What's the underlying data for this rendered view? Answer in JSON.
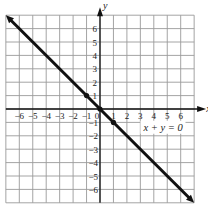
{
  "chart_data": {
    "type": "line",
    "title": "",
    "xlabel": "x",
    "ylabel": "y",
    "xlim": [
      -7,
      7
    ],
    "ylim": [
      -7,
      7
    ],
    "grid": true,
    "x_ticks": [
      -6,
      -5,
      -4,
      -3,
      -2,
      -1,
      0,
      1,
      2,
      3,
      4,
      5,
      6
    ],
    "y_ticks": [
      -6,
      -5,
      -4,
      -3,
      -2,
      -1,
      1,
      2,
      3,
      4,
      5,
      6
    ],
    "x_tick_labels": [
      "−6",
      "−5",
      "−4",
      "−3",
      "−2",
      "−1",
      "0",
      "1",
      "2",
      "3",
      "4",
      "5",
      "6"
    ],
    "y_tick_labels_pos": [
      "1",
      "2",
      "3",
      "4",
      "5",
      "6"
    ],
    "y_tick_labels_neg": [
      "−1",
      "−2",
      "−3",
      "−4",
      "−5",
      "−6"
    ],
    "series": [
      {
        "name": "x + y = 0",
        "equation": "x + y = 0",
        "x": [
          -7,
          7
        ],
        "y": [
          7,
          -7
        ],
        "arrows": "both",
        "color": "#111111"
      }
    ],
    "points": [
      {
        "x": -1,
        "y": 1
      },
      {
        "x": 0,
        "y": 0
      },
      {
        "x": 1,
        "y": -1
      }
    ],
    "annotation": {
      "text": "x + y = 0",
      "x": 4.2,
      "y": -1.4
    }
  },
  "labels": {
    "x_axis": "x",
    "y_axis": "y",
    "equation": "x + y = 0"
  },
  "colors": {
    "grid": "#9a9a9a",
    "axis": "#111111",
    "line": "#111111"
  }
}
